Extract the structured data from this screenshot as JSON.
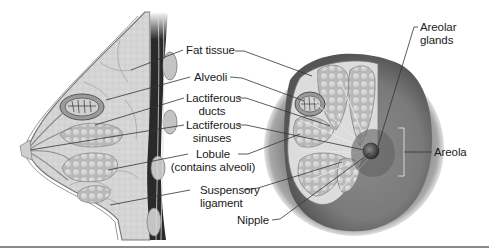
{
  "diagram": {
    "labels": [
      {
        "id": "fat-tissue",
        "line1": "Fat tissue",
        "line2": ""
      },
      {
        "id": "alveoli",
        "line1": "Alveoli",
        "line2": ""
      },
      {
        "id": "lactiferous-ducts",
        "line1": "Lactiferous",
        "line2": "ducts"
      },
      {
        "id": "lactiferous-sinuses",
        "line1": "Lactiferous",
        "line2": "sinuses"
      },
      {
        "id": "lobule",
        "line1": "Lobule",
        "line2": "(contains alveoli)"
      },
      {
        "id": "suspensory-ligament",
        "line1": "Suspensory",
        "line2": "ligament"
      },
      {
        "id": "nipple",
        "line1": "Nipple",
        "line2": ""
      },
      {
        "id": "areolar-glands",
        "line1": "Areolar",
        "line2": "glands"
      },
      {
        "id": "areola",
        "line1": "Areola",
        "line2": ""
      }
    ],
    "views": {
      "left": "Sagittal section",
      "right": "Anterior view with cutaway"
    },
    "colors": {
      "tissue": "#d9d9d9",
      "muscle": "#2a2a2a",
      "lobule": "#bdbdbd",
      "areola": "#5a5a5a",
      "leader": "#333333"
    }
  }
}
